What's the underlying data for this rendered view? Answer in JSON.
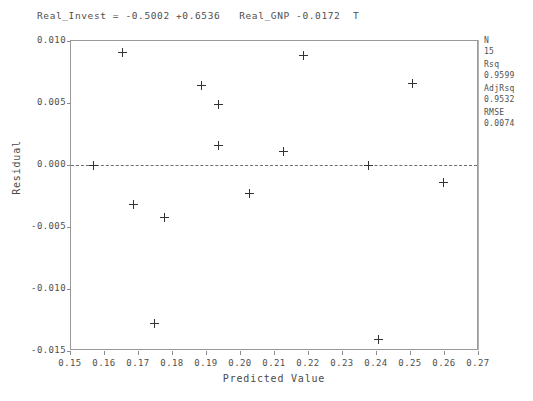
{
  "title": "Real_Invest = -0.5002 +0.6536   Real_GNP -0.0172  T",
  "axes": {
    "x_title": "Predicted Value",
    "y_title": "Residual",
    "x_ticks": [
      "0.15",
      "0.16",
      "0.17",
      "0.18",
      "0.19",
      "0.20",
      "0.21",
      "0.22",
      "0.23",
      "0.24",
      "0.25",
      "0.26",
      "0.27"
    ],
    "y_ticks": [
      "0.010",
      "0.005",
      "0.000",
      "-0.005",
      "-0.010",
      "-0.015"
    ]
  },
  "stats": [
    {
      "name": "N",
      "value": "15"
    },
    {
      "name": "Rsq",
      "value": "0.9599"
    },
    {
      "name": "AdjRsq",
      "value": "0.9532"
    },
    {
      "name": "RMSE",
      "value": "0.0074"
    }
  ],
  "chart_data": {
    "type": "scatter",
    "title": "Real_Invest = -0.5002 +0.6536   Real_GNP -0.0172  T",
    "xlabel": "Predicted Value",
    "ylabel": "Residual",
    "xlim": [
      0.15,
      0.27
    ],
    "ylim": [
      -0.015,
      0.01
    ],
    "grid": false,
    "legend": false,
    "reference_line": {
      "orientation": "horizontal",
      "y": 0.0,
      "style": "dashed"
    },
    "marker": "plus",
    "x": [
      0.1565,
      0.165,
      0.1685,
      0.1745,
      0.1775,
      0.1885,
      0.1935,
      0.1935,
      0.2025,
      0.2125,
      0.2185,
      0.2405,
      0.2375,
      0.2505,
      0.2595
    ],
    "y": [
      0.0,
      0.0091,
      -0.0032,
      -0.0128,
      -0.0042,
      0.0064,
      0.0049,
      0.0016,
      -0.0023,
      0.0011,
      0.0088,
      -0.0141,
      0.0,
      0.0066,
      -0.0014
    ],
    "points": [
      {
        "x": 0.1565,
        "y": 0.0
      },
      {
        "x": 0.165,
        "y": 0.0091
      },
      {
        "x": 0.1685,
        "y": -0.0032
      },
      {
        "x": 0.1745,
        "y": -0.0128
      },
      {
        "x": 0.1775,
        "y": -0.0042
      },
      {
        "x": 0.1885,
        "y": 0.0064
      },
      {
        "x": 0.1935,
        "y": 0.0049
      },
      {
        "x": 0.1935,
        "y": 0.0016
      },
      {
        "x": 0.2025,
        "y": -0.0023
      },
      {
        "x": 0.2125,
        "y": 0.0011
      },
      {
        "x": 0.2185,
        "y": 0.0088
      },
      {
        "x": 0.2405,
        "y": -0.0141
      },
      {
        "x": 0.2375,
        "y": 0.0
      },
      {
        "x": 0.2505,
        "y": 0.0066
      },
      {
        "x": 0.2595,
        "y": -0.0014
      }
    ],
    "annotations": {
      "N": "15",
      "Rsq": "0.9599",
      "AdjRsq": "0.9532",
      "RMSE": "0.0074"
    }
  }
}
